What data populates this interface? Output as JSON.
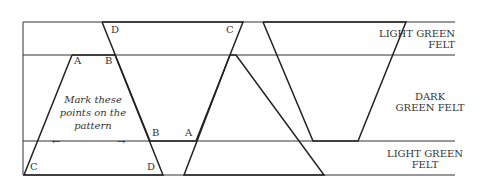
{
  "bands": {
    "top": {
      "label_line1": "LIGHT GREEN",
      "label_line2": "FELT"
    },
    "middle": {
      "label_line1": "DARK",
      "label_line2": "GREEN FELT"
    },
    "bottom": {
      "label_line1": "LIGHT GREEN",
      "label_line2": "FELT"
    }
  },
  "note": {
    "line1": "Mark these",
    "line2": "points on the",
    "line3": "pattern"
  },
  "points": {
    "t1_a": "A",
    "t1_b": "B",
    "t1_c": "C",
    "t1_d": "D",
    "t2_d": "D",
    "t2_c": "C",
    "t2_b": "B",
    "t2_a": "A"
  },
  "arrows": {
    "left": "←",
    "right": "→"
  }
}
